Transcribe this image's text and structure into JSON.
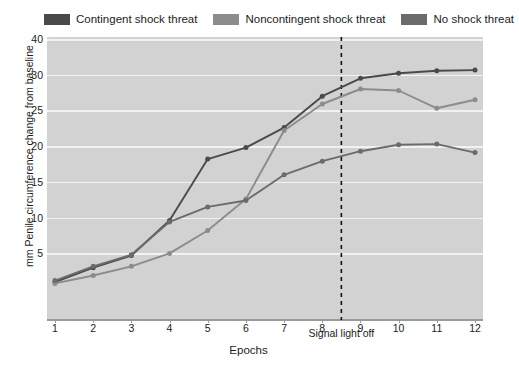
{
  "chart_data": {
    "type": "line",
    "title": "",
    "xlabel": "Epochs",
    "ylabel": "mm Penile circumference change from baseline",
    "x": [
      1,
      2,
      3,
      4,
      5,
      6,
      7,
      8,
      9,
      10,
      11,
      12
    ],
    "xtick_labels": [
      "1",
      "2",
      "3",
      "4",
      "5",
      "6",
      "7",
      "8",
      "9",
      "10",
      "11",
      "12"
    ],
    "ytick_labels": [
      "40",
      "30",
      "25",
      "20",
      "15",
      "10",
      "5"
    ],
    "ytick_values": [
      40,
      30,
      25,
      20,
      15,
      10,
      5
    ],
    "ylim": [
      0,
      40
    ],
    "grid": true,
    "legend_position": "top",
    "annotations": [
      {
        "label": "Signal light off",
        "x": 8.5,
        "style": "vertical-dashed-line"
      }
    ],
    "series": [
      {
        "name": "Contingent shock threat",
        "color": "#4a4a4a",
        "values": [
          1.0,
          3.0,
          4.7,
          9.6,
          18.2,
          19.8,
          22.6,
          27.0,
          29.5,
          30.4,
          31.1,
          31.3
        ]
      },
      {
        "name": "Noncontingent shock threat",
        "color": "#8c8c8c",
        "values": [
          0.8,
          1.9,
          3.2,
          5.0,
          8.2,
          12.6,
          22.2,
          25.9,
          28.0,
          27.8,
          25.3,
          26.5
        ]
      },
      {
        "name": "No shock threat",
        "color": "#6b6b6b",
        "values": [
          1.2,
          3.2,
          4.8,
          9.4,
          11.5,
          12.4,
          16.0,
          17.9,
          19.3,
          20.2,
          20.3,
          19.1
        ]
      }
    ]
  },
  "legend": {
    "items": [
      {
        "label": "Contingent shock threat",
        "color": "#4a4a4a"
      },
      {
        "label": "Noncontingent shock threat",
        "color": "#8c8c8c"
      },
      {
        "label": "No shock threat",
        "color": "#6b6b6b"
      }
    ]
  },
  "axes": {
    "x_title": "Epochs",
    "y_title": "mm Penile circumference change from baseline"
  },
  "annotation": {
    "signal_light_off": "Signal light off"
  },
  "colors": {
    "plot_background": "#d2d2d2",
    "gridline": "#f2f2f2",
    "axis": "#9a9a9a",
    "text": "#1c1c1c",
    "page_background": "#ffffff"
  }
}
